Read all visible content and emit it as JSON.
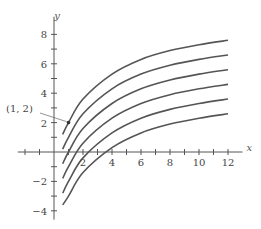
{
  "chart_data": {
    "type": "line",
    "title": "",
    "xlabel": "x",
    "ylabel": "y",
    "xlim": [
      -2.5,
      13
    ],
    "ylim": [
      -4.6,
      9.2
    ],
    "x_ticks": [
      2,
      4,
      6,
      8,
      10,
      12
    ],
    "x_minor_ticks": [
      -2,
      -1,
      1,
      3,
      5,
      7,
      9,
      11
    ],
    "y_ticks": [
      -4,
      -2,
      2,
      4,
      6,
      8
    ],
    "y_minor_ticks": [
      -3,
      -1,
      1,
      3,
      5,
      7
    ],
    "grid": false,
    "legend": null,
    "annotation": {
      "text": "(1, 2)",
      "point": [
        1,
        2
      ]
    },
    "series": [
      {
        "name": "curve C=2",
        "x": [
          0.6,
          1,
          2,
          4,
          6,
          8,
          10,
          12
        ],
        "y": [
          1.2,
          2.0,
          3.6,
          5.3,
          6.3,
          6.9,
          7.3,
          7.6
        ]
      },
      {
        "name": "curve C=1",
        "x": [
          0.6,
          1,
          2,
          4,
          6,
          8,
          10,
          12
        ],
        "y": [
          0.2,
          1.0,
          2.6,
          4.3,
          5.3,
          5.9,
          6.3,
          6.6
        ]
      },
      {
        "name": "curve C=0",
        "x": [
          0.6,
          1,
          2,
          4,
          6,
          8,
          10,
          12
        ],
        "y": [
          -0.8,
          0.0,
          1.6,
          3.3,
          4.3,
          4.9,
          5.3,
          5.6
        ]
      },
      {
        "name": "curve C=-1",
        "x": [
          0.6,
          1,
          2,
          4,
          6,
          8,
          10,
          12
        ],
        "y": [
          -1.8,
          -1.0,
          0.6,
          2.3,
          3.3,
          3.9,
          4.3,
          4.6
        ]
      },
      {
        "name": "curve C=-2",
        "x": [
          0.6,
          1,
          2,
          4,
          6,
          8,
          10,
          12
        ],
        "y": [
          -2.8,
          -2.0,
          -0.4,
          1.3,
          2.3,
          2.9,
          3.3,
          3.6
        ]
      },
      {
        "name": "curve C=-3",
        "x": [
          0.6,
          1,
          2,
          4,
          6,
          8,
          10,
          12
        ],
        "y": [
          -3.6,
          -3.0,
          -1.4,
          0.3,
          1.3,
          1.9,
          2.3,
          2.6
        ]
      }
    ],
    "colors": {
      "curve": "#555555",
      "axis": "#555555",
      "text": "#444444"
    }
  }
}
